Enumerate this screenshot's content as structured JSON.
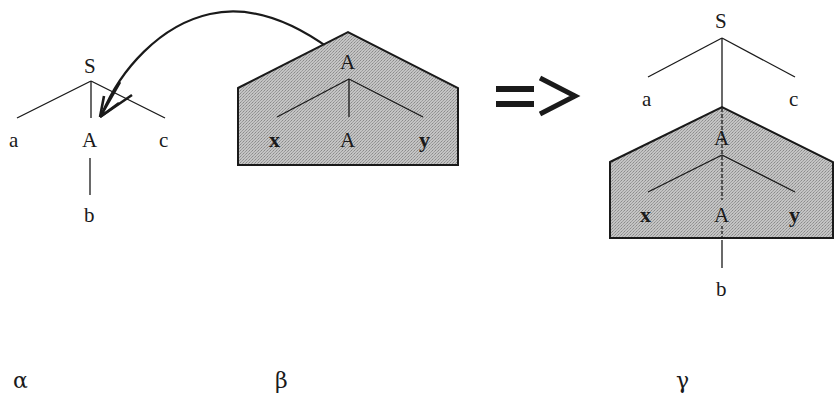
{
  "diagram": {
    "type": "tree-adjunction",
    "colors": {
      "ink": "#1a1a1a",
      "auxiliary_fill": "#b8b8b8",
      "background": "#ffffff"
    },
    "alpha_tree": {
      "caption": "α",
      "root": "S",
      "children": [
        "a",
        "A",
        "c"
      ],
      "A_child": "b"
    },
    "beta_tree": {
      "caption": "β",
      "root": "A",
      "children": [
        "x",
        "A",
        "y"
      ]
    },
    "operator": {
      "symbol": "=>"
    },
    "gamma_tree": {
      "caption": "γ",
      "root": "S",
      "left_child": "a",
      "right_child": "c",
      "adjoined_root": "A",
      "adjoined_children": [
        "x",
        "A",
        "y"
      ],
      "foot_child": "b"
    },
    "arrow": {
      "from": "beta_tree.root",
      "to": "alpha_tree.A",
      "meaning": "adjunction site"
    }
  }
}
